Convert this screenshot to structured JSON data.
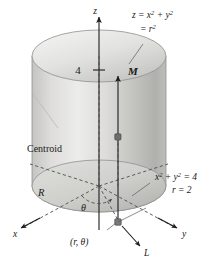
{
  "figure": {
    "background_color": "#ffffff",
    "ink_color": "#1a1a1a"
  },
  "axes": {
    "z_label": "z",
    "x_label": "x",
    "y_label": "y",
    "tick_value": "4"
  },
  "labels": {
    "surface_line1_main": "z = x",
    "surface_line1_sup1": "2",
    "surface_line1_mid": " + y",
    "surface_line1_sup2": "2",
    "surface_line2_main": "= r",
    "surface_line2_sup": "2",
    "circle_line1_main": "x",
    "circle_line1_sup1": "2",
    "circle_line1_mid": " + y",
    "circle_line1_sup2": "2",
    "circle_line1_end": " = 4",
    "circle_line2": "r = 2",
    "centroid": "Centroid",
    "region": "R",
    "theta": "θ",
    "polar_point": "(r, θ)",
    "line_L": "L",
    "vector_M": "M"
  },
  "colors": {
    "cylinder_body_light": "#e2e2e0",
    "cylinder_body_mid": "#c9c9c6",
    "cylinder_body_dark": "#a9a9a6",
    "top_cap_light": "#efefed",
    "top_cap_dark": "#c2c2bf",
    "base_disk_light": "#d8d8d5",
    "base_disk_dark": "#b4b4b1",
    "outline": "#8f8f90",
    "dash": "#4c4c4c",
    "axis": "#1c1c1c",
    "marker": "#6e6e6e"
  },
  "geometry": {
    "top_cap_center_x": 99,
    "top_cap_center_y": 56,
    "base_center_x": 99,
    "base_center_y": 186,
    "radius_x": 67,
    "radius_y": 26,
    "centroid_x": 118,
    "centroid_y": 137,
    "point_x": 118,
    "point_y": 222
  }
}
